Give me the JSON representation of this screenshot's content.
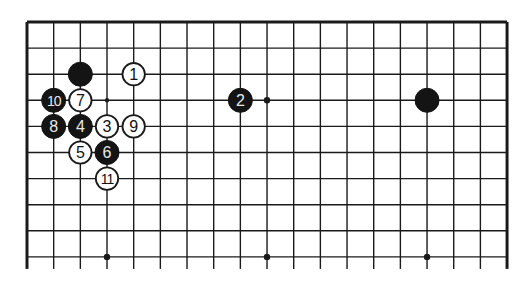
{
  "diagram": {
    "type": "go-board-partial",
    "colors": {
      "background": "#ffffff",
      "line": "#1a1a1a",
      "black": "#141414",
      "white": "#ffffff"
    },
    "grid": {
      "cols": 19,
      "rows_shown": 10,
      "origin_x": 27,
      "origin_y": 22,
      "step_x": 26.67,
      "step_y": 26.1,
      "bottom_extend": 12
    },
    "hoshi": [
      {
        "col": 3,
        "row": 9
      },
      {
        "col": 9,
        "row": 9
      },
      {
        "col": 15,
        "row": 9
      },
      {
        "col": 9,
        "row": 3
      }
    ],
    "markers": [
      {
        "col": 3,
        "row": 3,
        "type": "dot"
      }
    ],
    "stones": [
      {
        "color": "black",
        "col": 2,
        "row": 2,
        "label": ""
      },
      {
        "color": "black",
        "col": 15,
        "row": 3,
        "label": ""
      },
      {
        "color": "white",
        "col": 4,
        "row": 2,
        "label": "1"
      },
      {
        "color": "black",
        "col": 8,
        "row": 3,
        "label": "2"
      },
      {
        "color": "white",
        "col": 3,
        "row": 4,
        "label": "3"
      },
      {
        "color": "black",
        "col": 2,
        "row": 4,
        "label": "4"
      },
      {
        "color": "white",
        "col": 2,
        "row": 5,
        "label": "5"
      },
      {
        "color": "black",
        "col": 3,
        "row": 5,
        "label": "6"
      },
      {
        "color": "white",
        "col": 2,
        "row": 3,
        "label": "7"
      },
      {
        "color": "black",
        "col": 1,
        "row": 4,
        "label": "8"
      },
      {
        "color": "white",
        "col": 4,
        "row": 4,
        "label": "9"
      },
      {
        "color": "black",
        "col": 1,
        "row": 3,
        "label": "10"
      },
      {
        "color": "white",
        "col": 3,
        "row": 6,
        "label": "11"
      }
    ]
  }
}
